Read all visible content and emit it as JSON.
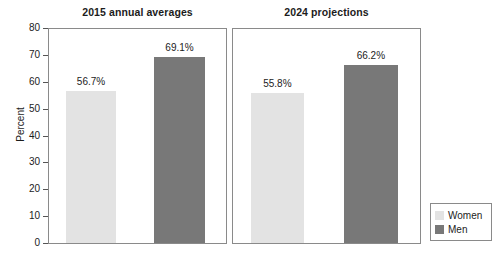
{
  "chart_data": {
    "type": "bar",
    "title": "",
    "xlabel": "",
    "ylabel": "Percent",
    "ylim": [
      0,
      80
    ],
    "ytick_step": 10,
    "yticks": [
      "80",
      "70",
      "60",
      "50",
      "40",
      "30",
      "20",
      "10",
      "0"
    ],
    "grid": false,
    "legend_position": "bottom-right-outside",
    "legend": [
      "Women",
      "Men"
    ],
    "panels": [
      {
        "title": "2015 annual averages",
        "bars": [
          {
            "series": "Women",
            "value": 56.7,
            "label": "56.7%",
            "color": "#e3e3e3"
          },
          {
            "series": "Men",
            "value": 69.1,
            "label": "69.1%",
            "color": "#787878"
          }
        ]
      },
      {
        "title": "2024 projections",
        "bars": [
          {
            "series": "Women",
            "value": 55.8,
            "label": "55.8%",
            "color": "#e3e3e3"
          },
          {
            "series": "Men",
            "value": 66.2,
            "label": "66.2%",
            "color": "#787878"
          }
        ]
      }
    ]
  },
  "colors": {
    "women": "#e3e3e3",
    "men": "#787878",
    "axis": "#8a8a8a",
    "text": "#1c1c1c",
    "background": "#ffffff"
  }
}
